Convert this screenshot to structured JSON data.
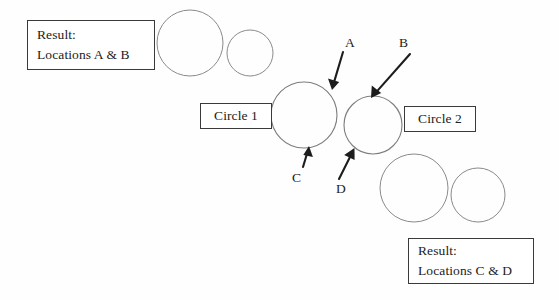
{
  "canvas": {
    "width": 559,
    "height": 300,
    "background": "#fefefe",
    "stroke_circle": "#8a8a8a",
    "stroke_box": "#3a3a3a",
    "stroke_arrow": "#1d1d1d"
  },
  "boxes": {
    "result_ab": {
      "title": "Result:",
      "detail": "Locations A & B",
      "x": 27,
      "y": 20,
      "width": 128,
      "height": 50
    },
    "circle1": {
      "label": "Circle 1",
      "x": 200,
      "y": 103,
      "width": 72,
      "height": 26
    },
    "circle2": {
      "label": "Circle 2",
      "x": 404,
      "y": 106,
      "width": 72,
      "height": 26
    },
    "result_cd": {
      "title": "Result:",
      "detail": "Locations C & D",
      "x": 408,
      "y": 238,
      "width": 126,
      "height": 46
    }
  },
  "arrows": [
    {
      "id": "A",
      "letter": "A",
      "letter_x": 345,
      "letter_y": 36,
      "x1": 343,
      "y1": 52,
      "x2": 332,
      "y2": 89,
      "points_to": "circle-1-upper-right"
    },
    {
      "id": "B",
      "letter": "B",
      "letter_x": 399,
      "letter_y": 36,
      "x1": 410,
      "y1": 54,
      "x2": 371,
      "y2": 98,
      "points_to": "circle-2-upper-left"
    },
    {
      "id": "C",
      "letter": "C",
      "letter_x": 292,
      "letter_y": 171,
      "x1": 303,
      "y1": 167,
      "x2": 309,
      "y2": 147,
      "points_to": "circle-1-bottom"
    },
    {
      "id": "D",
      "letter": "D",
      "letter_x": 336,
      "letter_y": 182,
      "x1": 339,
      "y1": 179,
      "x2": 354,
      "y2": 149,
      "points_to": "circle-2-lower-left"
    }
  ],
  "circles": {
    "result_ab_pair": [
      {
        "name": "large",
        "cx": 190,
        "cy": 43,
        "r": 33
      },
      {
        "name": "small",
        "cx": 250,
        "cy": 53,
        "r": 23
      }
    ],
    "main_pair": [
      {
        "name": "circle-1",
        "cx": 304,
        "cy": 115,
        "r": 33
      },
      {
        "name": "circle-2",
        "cx": 373,
        "cy": 125,
        "r": 29
      }
    ],
    "result_cd_pair": [
      {
        "name": "large",
        "cx": 414,
        "cy": 188,
        "r": 34
      },
      {
        "name": "small",
        "cx": 478,
        "cy": 195,
        "r": 27
      }
    ]
  }
}
